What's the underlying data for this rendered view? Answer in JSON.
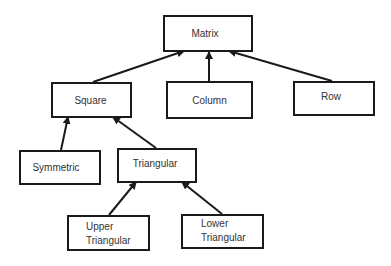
{
  "diagram": {
    "type": "hierarchy",
    "nodes": [
      {
        "id": "matrix",
        "label": "Matrix"
      },
      {
        "id": "square",
        "label": "Square"
      },
      {
        "id": "column",
        "label": "Column"
      },
      {
        "id": "row",
        "label": "Row"
      },
      {
        "id": "symmetric",
        "label": "Symmetric"
      },
      {
        "id": "triangular",
        "label": "Triangular"
      },
      {
        "id": "upper",
        "label_line1": "Upper",
        "label_line2": "Triangular"
      },
      {
        "id": "lower",
        "label_line1": "Lower",
        "label_line2": "Triangular"
      }
    ],
    "edges": [
      {
        "from": "Square",
        "to": "Matrix"
      },
      {
        "from": "Column",
        "to": "Matrix"
      },
      {
        "from": "Row",
        "to": "Matrix"
      },
      {
        "from": "Symmetric",
        "to": "Square"
      },
      {
        "from": "Triangular",
        "to": "Square"
      },
      {
        "from": "Upper Triangular",
        "to": "Triangular"
      },
      {
        "from": "Lower Triangular",
        "to": "Triangular"
      }
    ],
    "colors": {
      "stroke": "#1a1a1a",
      "text": "#333333",
      "background": "#ffffff"
    }
  }
}
